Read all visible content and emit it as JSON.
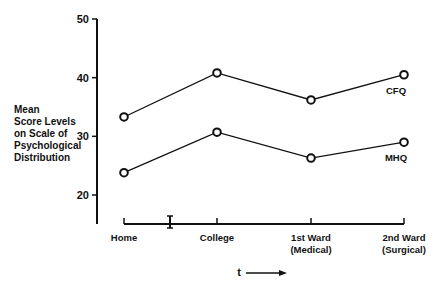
{
  "chart_data": {
    "type": "line",
    "title": "",
    "xlabel": "t",
    "ylabel": "Mean Score Levels on Scale of Psychological Distribution",
    "ylabel_lines": [
      "Mean",
      "Score Levels",
      "on Scale of",
      "Psychological",
      "Distribution"
    ],
    "categories": [
      "Home",
      "College",
      "1st Ward (Medical)",
      "2nd Ward (Surgical)"
    ],
    "category_lines": [
      [
        "Home"
      ],
      [
        "College"
      ],
      [
        "1st Ward",
        "(Medical)"
      ],
      [
        "2nd Ward",
        "(Surgical)"
      ]
    ],
    "series": [
      {
        "name": "CFQ",
        "values": [
          33.3,
          40.8,
          36.2,
          40.5
        ]
      },
      {
        "name": "MHQ",
        "values": [
          23.8,
          30.7,
          26.3,
          29.0
        ]
      }
    ],
    "yticks": [
      20,
      30,
      40,
      50
    ],
    "ylim": [
      15,
      50
    ],
    "grid": false,
    "legend": "inline labels at right end of each series",
    "annotations": [
      "I-shaped break marker on x-axis between Home and College",
      "arrow after 't' indicating time direction"
    ]
  }
}
